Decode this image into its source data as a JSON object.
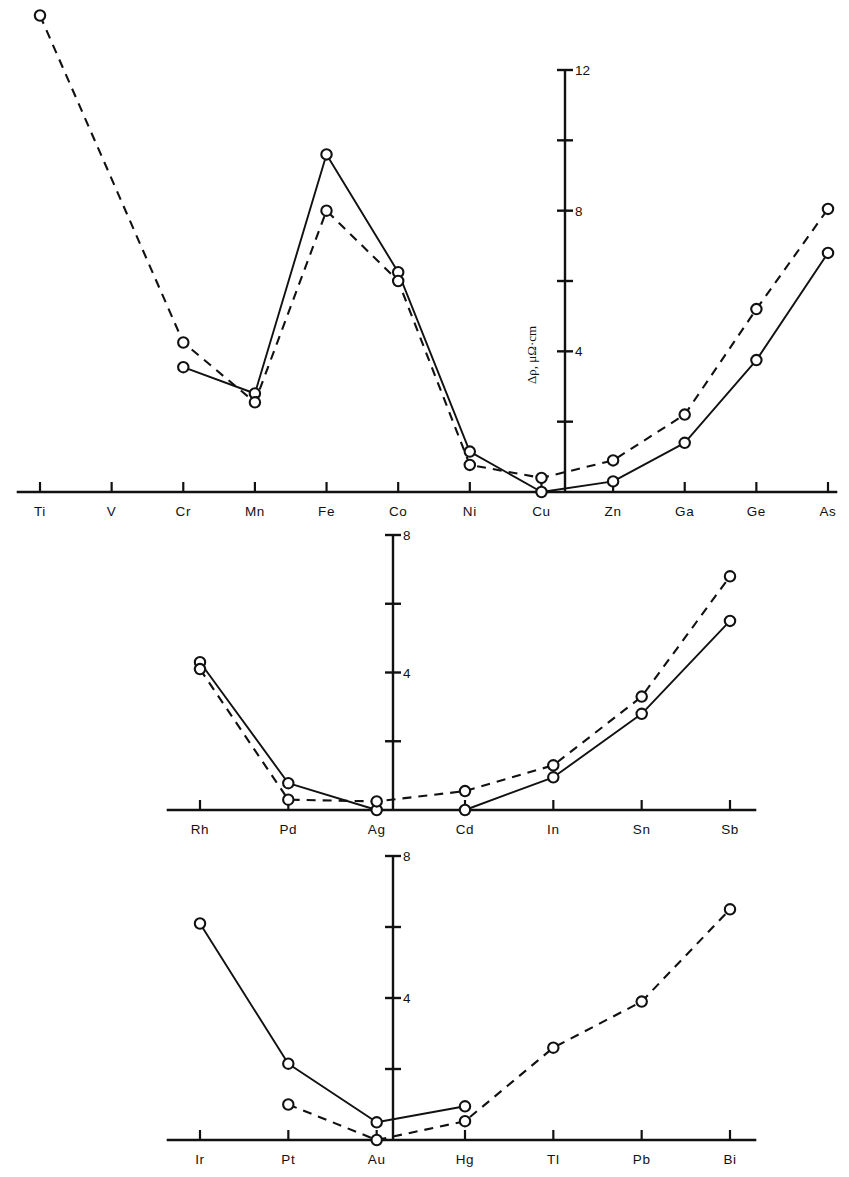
{
  "figure": {
    "background_color": "#ffffff",
    "ink_color": "#111111",
    "marker_style": "open-circle",
    "series_styles": [
      "solid",
      "dashed"
    ]
  },
  "chart_data": [
    {
      "type": "line",
      "panel": "top",
      "title": "",
      "xlabel": "",
      "ylabel": "Δρ, μΩ·cm",
      "ylim": [
        0,
        12
      ],
      "ytick_values": [
        2,
        4,
        6,
        8,
        10,
        12
      ],
      "ytick_labels": [
        "",
        "4",
        "",
        "8",
        "",
        "12"
      ],
      "grid": false,
      "legend_position": "none",
      "categories": [
        "Ti",
        "V",
        "Cr",
        "Mn",
        "Fe",
        "Co",
        "Ni",
        "Cu",
        "Zn",
        "Ga",
        "Ge",
        "As"
      ],
      "series": [
        {
          "name": "solid",
          "style": "solid",
          "values": [
            null,
            null,
            3.55,
            2.8,
            9.6,
            6.25,
            1.15,
            0.0,
            0.3,
            1.4,
            3.75,
            6.8
          ]
        },
        {
          "name": "dashed",
          "style": "dashed",
          "values": [
            13.55,
            null,
            4.25,
            2.55,
            8.0,
            6.0,
            0.77,
            0.4,
            0.9,
            2.2,
            5.2,
            8.05
          ]
        }
      ]
    },
    {
      "type": "line",
      "panel": "middle",
      "title": "",
      "xlabel": "",
      "ylabel": "",
      "ylim": [
        0,
        8
      ],
      "ytick_values": [
        2,
        4,
        6,
        8
      ],
      "ytick_labels": [
        "",
        "4",
        "",
        "8"
      ],
      "grid": false,
      "legend_position": "none",
      "categories": [
        "Rh",
        "Pd",
        "Ag",
        "Cd",
        "In",
        "Sn",
        "Sb"
      ],
      "series": [
        {
          "name": "solid",
          "style": "solid",
          "values": [
            4.3,
            0.78,
            0.0,
            0.0,
            0.95,
            2.8,
            5.5
          ]
        },
        {
          "name": "dashed",
          "style": "dashed",
          "values": [
            4.1,
            0.3,
            0.25,
            0.55,
            1.3,
            3.3,
            6.8
          ]
        }
      ]
    },
    {
      "type": "line",
      "panel": "bottom",
      "title": "",
      "xlabel": "",
      "ylabel": "",
      "ylim": [
        0,
        8
      ],
      "ytick_values": [
        2,
        4,
        6,
        8
      ],
      "ytick_labels": [
        "",
        "4",
        "",
        "8"
      ],
      "grid": false,
      "legend_position": "none",
      "categories": [
        "Ir",
        "Pt",
        "Au",
        "Hg",
        "Tl",
        "Pb",
        "Bi"
      ],
      "series": [
        {
          "name": "solid",
          "style": "solid",
          "values": [
            6.1,
            2.15,
            0.5,
            0.95,
            null,
            null,
            null
          ]
        },
        {
          "name": "dashed",
          "style": "dashed",
          "values": [
            null,
            1.0,
            0.0,
            0.53,
            2.6,
            3.9,
            6.5
          ]
        }
      ]
    }
  ],
  "panels": {
    "top": {
      "y_axis_title": "Δρ, μΩ·cm",
      "y_labels": [
        "12",
        "8",
        "4"
      ],
      "x_labels": [
        "Ti",
        "V",
        "Cr",
        "Mn",
        "Fe",
        "Co",
        "Ni",
        "Cu",
        "Zn",
        "Ga",
        "Ge",
        "As"
      ]
    },
    "middle": {
      "y_labels": [
        "8",
        "4"
      ],
      "x_labels": [
        "Rh",
        "Pd",
        "Ag",
        "Cd",
        "In",
        "Sn",
        "Sb"
      ]
    },
    "bottom": {
      "y_labels": [
        "8",
        "4"
      ],
      "x_labels": [
        "Ir",
        "Pt",
        "Au",
        "Hg",
        "Tl",
        "Pb",
        "Bi"
      ]
    }
  }
}
